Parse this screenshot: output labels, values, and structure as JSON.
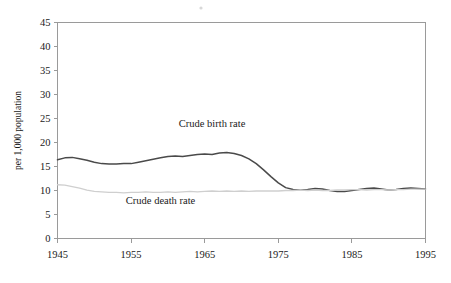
{
  "chart_data": {
    "type": "line",
    "title": "",
    "xlabel": "",
    "ylabel": "per 1,000 population",
    "xlim": [
      1945,
      1995
    ],
    "ylim": [
      0,
      45
    ],
    "xticks": [
      1945,
      1955,
      1965,
      1975,
      1985,
      1995
    ],
    "yticks": [
      0,
      5,
      10,
      15,
      20,
      25,
      30,
      35,
      40,
      45
    ],
    "grid": false,
    "legend_position": "inline-annotation",
    "series": [
      {
        "name": "Crude birth rate",
        "color": "#4a4a4a",
        "label_x": 1966,
        "label_y": 23.2,
        "x": [
          1945,
          1946,
          1947,
          1948,
          1949,
          1950,
          1951,
          1952,
          1953,
          1954,
          1955,
          1956,
          1957,
          1958,
          1959,
          1960,
          1961,
          1962,
          1963,
          1964,
          1965,
          1966,
          1967,
          1968,
          1969,
          1970,
          1971,
          1972,
          1973,
          1974,
          1975,
          1976,
          1977,
          1978,
          1979,
          1980,
          1981,
          1982,
          1983,
          1984,
          1985,
          1986,
          1987,
          1988,
          1989,
          1990,
          1991,
          1992,
          1993,
          1994,
          1995
        ],
        "values": [
          16.4,
          16.8,
          16.9,
          16.6,
          16.3,
          15.9,
          15.6,
          15.5,
          15.5,
          15.6,
          15.6,
          15.9,
          16.2,
          16.5,
          16.8,
          17.1,
          17.2,
          17.1,
          17.3,
          17.5,
          17.6,
          17.5,
          17.8,
          17.9,
          17.7,
          17.3,
          16.6,
          15.6,
          14.3,
          12.9,
          11.6,
          10.6,
          10.2,
          10.1,
          10.2,
          10.4,
          10.3,
          10.0,
          9.8,
          9.8,
          10.0,
          10.2,
          10.4,
          10.5,
          10.3,
          10.1,
          10.2,
          10.4,
          10.5,
          10.4,
          10.3
        ]
      },
      {
        "name": "Crude death rate",
        "color": "#cfcfcf",
        "label_x": 1959,
        "label_y": 7.1,
        "x": [
          1945,
          1946,
          1947,
          1948,
          1949,
          1950,
          1951,
          1952,
          1953,
          1954,
          1955,
          1956,
          1957,
          1958,
          1959,
          1960,
          1961,
          1962,
          1963,
          1964,
          1965,
          1966,
          1967,
          1968,
          1969,
          1970,
          1971,
          1972,
          1973,
          1974,
          1975,
          1976,
          1977,
          1978,
          1979,
          1980,
          1981,
          1982,
          1983,
          1984,
          1985,
          1986,
          1987,
          1988,
          1989,
          1990,
          1991,
          1992,
          1993,
          1994,
          1995
        ],
        "values": [
          11.2,
          11.1,
          10.8,
          10.5,
          10.1,
          9.8,
          9.7,
          9.6,
          9.6,
          9.5,
          9.6,
          9.6,
          9.7,
          9.6,
          9.6,
          9.7,
          9.6,
          9.7,
          9.8,
          9.7,
          9.8,
          9.9,
          9.8,
          9.9,
          9.8,
          9.9,
          9.8,
          9.9,
          9.9,
          9.9,
          9.9,
          10.0,
          10.0,
          10.1,
          10.0,
          10.1,
          10.0,
          10.0,
          10.1,
          10.1,
          10.2,
          10.2,
          10.1,
          10.2,
          10.2,
          10.1,
          10.2,
          10.2,
          10.3,
          10.3,
          10.3
        ]
      }
    ]
  }
}
